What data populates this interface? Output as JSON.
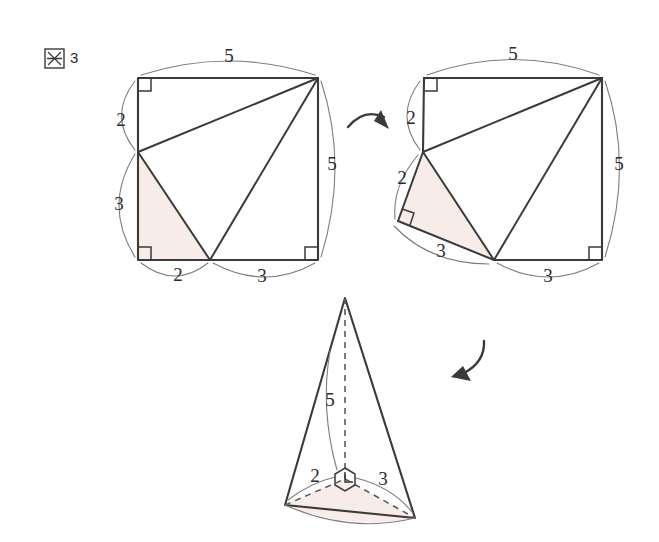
{
  "figure": {
    "caption_label": "図",
    "caption_number": "3",
    "caption_full": "図 3",
    "colors": {
      "ink": "#3a3a3a",
      "arc": "#7d7d7d",
      "shade_fill": "#f8ece9",
      "background": "#ffffff"
    }
  },
  "panels": {
    "square_before": {
      "name": "square-unfolded",
      "labels": {
        "top": "5",
        "right": "5",
        "left_upper": "2",
        "left_lower": "3",
        "bottom_left": "2",
        "bottom_right": "3"
      },
      "right_angle_count": 3,
      "shaded_triangle_legs": [
        "2",
        "3"
      ]
    },
    "square_after": {
      "name": "square-folded",
      "labels": {
        "top": "5",
        "right": "5",
        "left_upper": "2",
        "flap_upper": "2",
        "flap_lower": "3",
        "bottom_right": "3"
      },
      "right_angle_count": 3,
      "flap_right_angle": true
    },
    "pyramid": {
      "name": "pyramid-assembled",
      "labels": {
        "height": "5",
        "base_left": "2",
        "base_right": "3"
      },
      "apex_angle_marker": "hexagon-right-angle-marker"
    }
  },
  "arrows": [
    {
      "name": "arrow-fold",
      "direction": "right"
    },
    {
      "name": "arrow-assemble",
      "direction": "down-left"
    }
  ]
}
